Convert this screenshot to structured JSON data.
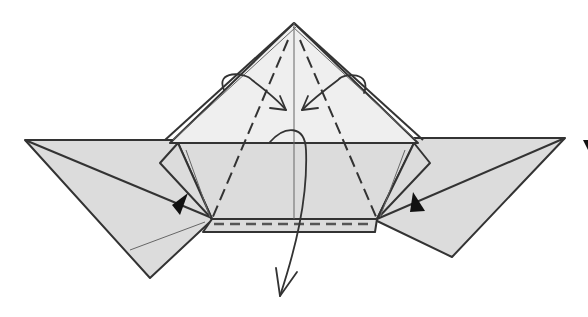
{
  "diagram": {
    "type": "origami-fold-diagram",
    "colors": {
      "paper_shaded": "#dcdcdc",
      "paper_light": "#efefef",
      "line": "#333333",
      "background": "#ffffff"
    },
    "symbols": [
      {
        "name": "valley-fold-line",
        "count": 3
      },
      {
        "name": "fold-arrow",
        "count": 3
      },
      {
        "name": "push-arrow",
        "count": 2
      }
    ]
  }
}
